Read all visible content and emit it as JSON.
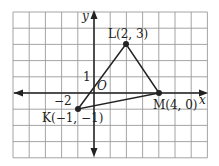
{
  "figure": {
    "grid": {
      "x_min": -5,
      "x_max": 7,
      "y_min": -4,
      "y_max": 5,
      "color": "#9a9a9a"
    },
    "axes": {
      "x_label": "x",
      "y_label": "y",
      "origin_label": "O",
      "tick_x": "−2",
      "tick_y": "1"
    },
    "points": [
      {
        "name": "K",
        "label": "K(−1, −1)",
        "x": -1,
        "y": -1
      },
      {
        "name": "L",
        "label": "L(2, 3)",
        "x": 2,
        "y": 3
      },
      {
        "name": "M",
        "label": "M(4, 0)",
        "x": 4,
        "y": 0
      }
    ],
    "triangle": [
      "K",
      "L",
      "M"
    ]
  }
}
